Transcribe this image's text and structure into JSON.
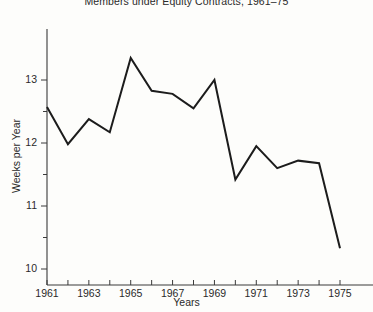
{
  "chart_data": {
    "type": "line",
    "title": "Members under Equity Contracts, 1961–75",
    "xlabel": "Years",
    "ylabel": "Weeks per Year",
    "x": [
      1961,
      1962,
      1963,
      1964,
      1965,
      1966,
      1967,
      1968,
      1969,
      1970,
      1971,
      1972,
      1973,
      1974,
      1975
    ],
    "values": [
      12.57,
      11.98,
      12.38,
      12.17,
      13.35,
      12.83,
      12.78,
      12.55,
      13.0,
      11.42,
      11.95,
      11.6,
      11.72,
      11.68,
      10.33
    ],
    "xlim": [
      1961,
      1975
    ],
    "ylim": [
      10,
      13.55
    ],
    "xticks": [
      1961,
      1962,
      1963,
      1964,
      1965,
      1966,
      1967,
      1968,
      1969,
      1970,
      1971,
      1972,
      1973,
      1974,
      1975
    ],
    "xtick_labels": [
      "1961",
      "",
      "1963",
      "",
      "1965",
      "",
      "1967",
      "",
      "1969",
      "",
      "1971",
      "",
      "1973",
      "",
      "1975"
    ],
    "yticks": [
      10,
      10.5,
      11,
      11.5,
      12,
      12.5,
      13
    ],
    "ytick_labels": [
      "10",
      "",
      "11",
      "",
      "12",
      "",
      "13"
    ],
    "grid": false,
    "legend": false,
    "line_color": "#1c1c1c",
    "axis_color": "#3a3a3a",
    "background": "#fdfdfb"
  }
}
